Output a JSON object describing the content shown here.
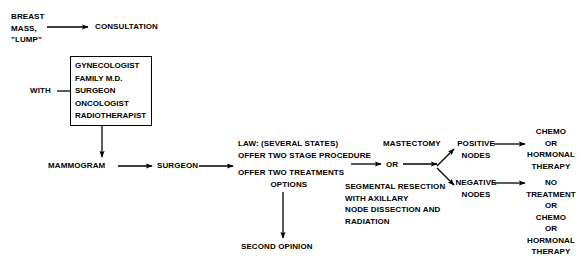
{
  "diagram": {
    "line_color": "#000000",
    "text_color": "#000000",
    "background": "#ffffff"
  },
  "nodes": {
    "breast_mass": "BREAST\nMASS,\n\"LUMP\"",
    "consultation": "CONSULTATION",
    "with_label": "WITH",
    "specialists": "GYNECOLOGIST\nFAMILY M.D.\nSURGEON\nONCOLOGIST\nRADIOTHERAPIST",
    "mammogram": "MAMMOGRAM",
    "surgeon": "SURGEON",
    "law": "LAW: (SEVERAL STATES)\nOFFER TWO STAGE PROCEDURE",
    "offer_two": "OFFER TWO TREATMENTS\n              OPTIONS",
    "second_opinion": "SECOND OPINION",
    "mastectomy": "MASTECTOMY",
    "or_label": "OR",
    "segmental": "SEGMENTAL RESECTION\nWITH AXILLARY\nNODE DISSECTION AND\nRADIATION",
    "positive_nodes": "POSITIVE\nNODES",
    "negative_nodes": "NEGATIVE\nNODES",
    "chemo_outcome": "CHEMO\nOR\nHORMONAL\nTHERAPY",
    "no_treatment_outcome": "NO\nTREATMENT\nOR\nCHEMO\nOR\nHORMONAL\nTHERAPY"
  },
  "edges": [
    {
      "name": "breast-mass-to-consultation",
      "kind": "arrow-right"
    },
    {
      "name": "with-to-specialist-box",
      "kind": "line"
    },
    {
      "name": "specialist-box-to-mammogram",
      "kind": "arrow-down"
    },
    {
      "name": "mammogram-to-surgeon",
      "kind": "arrow-right"
    },
    {
      "name": "surgeon-to-options",
      "kind": "arrow-right"
    },
    {
      "name": "options-to-second-opinion",
      "kind": "arrow-down"
    },
    {
      "name": "options-to-or",
      "kind": "arrow-right"
    },
    {
      "name": "or-to-branch",
      "kind": "arrow-right"
    },
    {
      "name": "branch-to-positive-nodes",
      "kind": "arrow-up-right"
    },
    {
      "name": "branch-to-negative-nodes",
      "kind": "arrow-down-right"
    },
    {
      "name": "positive-nodes-to-chemo",
      "kind": "arrow-right"
    },
    {
      "name": "negative-nodes-to-no-treatment",
      "kind": "arrow-right"
    }
  ]
}
